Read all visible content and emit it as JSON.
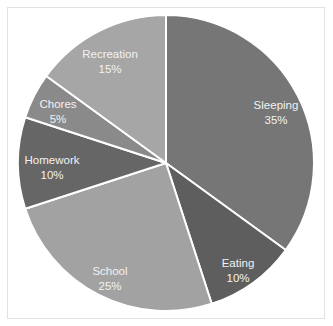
{
  "chart_data": {
    "type": "pie",
    "title": "",
    "start_angle_deg": 0,
    "direction": "clockwise",
    "categories": [
      "Sleeping",
      "Eating",
      "School",
      "Homework",
      "Chores",
      "Recreation"
    ],
    "values": [
      35,
      10,
      25,
      10,
      5,
      15
    ],
    "value_labels": [
      "35%",
      "10%",
      "25%",
      "10%",
      "5%",
      "15%"
    ],
    "colors": [
      "#767676",
      "#5e5e5e",
      "#a2a2a2",
      "#666666",
      "#8a8a8a",
      "#a6a6a6"
    ],
    "legend": "none",
    "data_labels": "inside, category name and percentage"
  },
  "chart": {
    "slices": [
      {
        "label": "Sleeping",
        "pct": "35%"
      },
      {
        "label": "Eating",
        "pct": "10%"
      },
      {
        "label": "School",
        "pct": "25%"
      },
      {
        "label": "Homework",
        "pct": "10%"
      },
      {
        "label": "Chores",
        "pct": "5%"
      },
      {
        "label": "Recreation",
        "pct": "15%"
      }
    ]
  }
}
